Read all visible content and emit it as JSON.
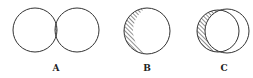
{
  "figure": {
    "stroke_color": "#333333",
    "background": "#ffffff",
    "diagrams": [
      {
        "label": "A",
        "shaded": "intersection of two circles"
      },
      {
        "label": "B",
        "shaded": "crescent on left side of circle"
      },
      {
        "label": "C",
        "shaded": "left circle minus right circle"
      }
    ]
  }
}
